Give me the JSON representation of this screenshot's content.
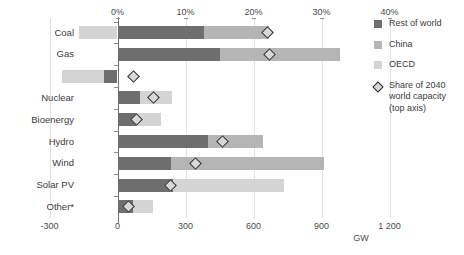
{
  "chart_data": {
    "type": "bar",
    "orientation": "horizontal",
    "stacked": true,
    "title": "",
    "subtitle": "",
    "categories": [
      "Coal",
      "Gas",
      "Oil",
      "Nuclear",
      "Bioenergy",
      "Hydro",
      "Wind",
      "Solar PV",
      "Other*"
    ],
    "series": [
      {
        "name": "Rest of world",
        "color": "#6e6e6e",
        "values": [
          380,
          450,
          -60,
          100,
          80,
          400,
          235,
          245,
          70
        ]
      },
      {
        "name": "China",
        "color": "#b5b5b5",
        "values": [
          290,
          530,
          0,
          0,
          0,
          240,
          675,
          0,
          0
        ]
      },
      {
        "name": "OECD",
        "color": "#d4d4d4",
        "values": [
          -170,
          0,
          -185,
          140,
          110,
          0,
          0,
          490,
          85
        ]
      }
    ],
    "marker_series": {
      "name": "Share of 2040 world capacity (top axis)",
      "axis": "top",
      "unit": "%",
      "values": [
        22.0,
        22.4,
        2.3,
        5.3,
        2.8,
        15.4,
        11.4,
        7.8,
        1.6
      ]
    },
    "bottom_axis": {
      "label": "GW",
      "ticks": [
        "-300",
        "0",
        "300",
        "600",
        "900",
        "1 200"
      ],
      "tick_values": [
        -300,
        0,
        300,
        600,
        900,
        1200
      ],
      "min": -300,
      "max": 1200
    },
    "top_axis": {
      "label": "",
      "ticks": [
        "0%",
        "10%",
        "20%",
        "30%",
        "40%"
      ],
      "tick_values": [
        0,
        10,
        20,
        30,
        40
      ],
      "min": -10,
      "max": 40
    },
    "grid": true,
    "legend_position": "right",
    "legend": [
      {
        "label": "Rest of world",
        "type": "swatch",
        "color": "#6e6e6e"
      },
      {
        "label": "China",
        "type": "swatch",
        "color": "#b5b5b5"
      },
      {
        "label": "OECD",
        "type": "swatch",
        "color": "#d4d4d4"
      },
      {
        "label": "Share of 2040\nworld capacity\n(top axis)",
        "type": "diamond",
        "color": "#d9d9d9"
      }
    ]
  }
}
